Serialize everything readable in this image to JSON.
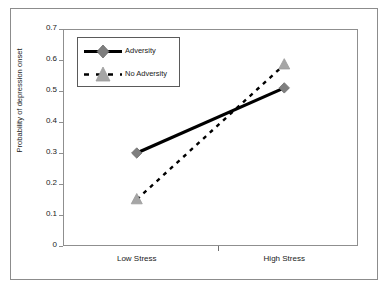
{
  "chart_data": {
    "type": "line",
    "title": "",
    "subtitle": "",
    "xlabel": "",
    "ylabel": "Probability of depression onset",
    "categories": [
      "Low Stress",
      "High Stress"
    ],
    "ylim": [
      0,
      0.7
    ],
    "yticks": [
      "0",
      "0.1",
      "0.2",
      "0.3",
      "0.4",
      "0.5",
      "0.6",
      "0.7"
    ],
    "ytick_values": [
      0,
      0.1,
      0.2,
      0.3,
      0.4,
      0.5,
      0.6,
      0.7
    ],
    "grid": false,
    "legend_position": "upper-left-inside",
    "series": [
      {
        "name": "Adversity",
        "values": [
          0.3,
          0.51
        ],
        "line_style": "solid",
        "marker": "diamond",
        "line_color": "#000000",
        "marker_color": "#7f7f7f"
      },
      {
        "name": "No Adversity",
        "values": [
          0.15,
          0.585
        ],
        "line_style": "dashed",
        "marker": "triangle",
        "line_color": "#000000",
        "marker_color": "#a6a6a6"
      }
    ]
  },
  "figure": {
    "border_color": "#8c8c8c",
    "axis_color": "#8f8f8f",
    "text_color": "#1a1a1a",
    "background": "#ffffff"
  }
}
